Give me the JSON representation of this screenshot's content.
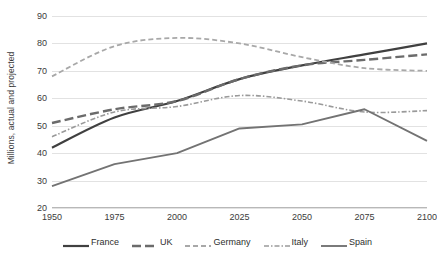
{
  "chart_data": {
    "type": "line",
    "title": "",
    "xlabel": "",
    "ylabel": "Millions, actual and projected",
    "x": [
      1950,
      1975,
      2000,
      2025,
      2050,
      2075,
      2100
    ],
    "categories": [
      "1950",
      "1975",
      "2000",
      "2025",
      "2050",
      "2075",
      "2100"
    ],
    "xlim": [
      1950,
      2100
    ],
    "ylim": [
      20,
      90
    ],
    "yticks": [
      20,
      30,
      40,
      50,
      60,
      70,
      80,
      90
    ],
    "ytick_labels": [
      "20",
      "30",
      "40",
      "50",
      "60",
      "70",
      "80",
      "90"
    ],
    "grid": "horizontal",
    "legend_position": "bottom",
    "series": [
      {
        "name": "France",
        "values": [
          42,
          53,
          59,
          67,
          72,
          76,
          80
        ],
        "color": "#404040",
        "style": "solid",
        "width": 2.2,
        "dasharray": ""
      },
      {
        "name": "UK",
        "values": [
          51,
          56,
          59,
          67,
          72,
          74,
          76
        ],
        "color": "#6b6b6b",
        "style": "dashed",
        "width": 2.4,
        "dasharray": "9,4"
      },
      {
        "name": "Germany",
        "values": [
          68,
          79,
          82,
          80,
          75,
          71,
          70
        ],
        "color": "#a8a8a8",
        "style": "dashed",
        "width": 1.8,
        "dasharray": "5,3"
      },
      {
        "name": "Italy",
        "values": [
          46,
          55,
          57,
          61,
          59,
          55,
          55.5
        ],
        "color": "#9a9a9a",
        "style": "dash-dot",
        "width": 1.6,
        "dasharray": "5,2,1.5,2"
      },
      {
        "name": "Spain",
        "values": [
          28,
          36,
          40,
          49,
          50.5,
          56,
          44.5
        ],
        "color": "#737373",
        "style": "solid",
        "width": 1.9,
        "dasharray": ""
      }
    ]
  },
  "axes": {
    "y_title": "Millions, actual and projected"
  },
  "colors": {
    "gridline": "#e2e2e2",
    "axis": "#b8b8b8",
    "text": "#3b3b3b",
    "background": "#ffffff"
  }
}
